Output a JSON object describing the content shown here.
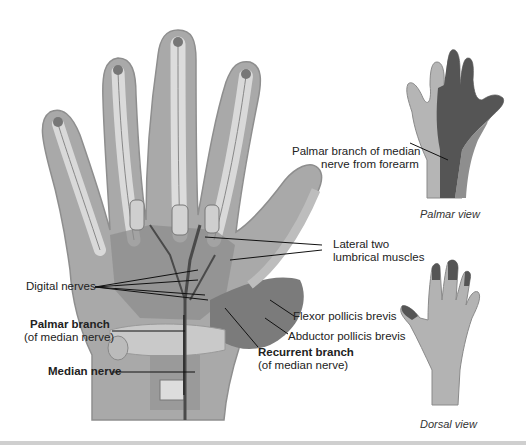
{
  "figure": {
    "main_view": {
      "labels": {
        "digital_nerves": "Digital nerves",
        "lateral_lumbricals_line1": "Lateral two",
        "lateral_lumbricals_line2": "lumbrical muscles",
        "palmar_branch_title": "Palmar branch",
        "palmar_branch_sub": "(of median nerve)",
        "median_nerve": "Median nerve",
        "flexor_pollicis_brevis": "Flexor pollicis brevis",
        "abductor_pollicis_brevis": "Abductor pollicis brevis",
        "recurrent_branch_title": "Recurrent branch",
        "recurrent_branch_sub": "(of median nerve)"
      }
    },
    "palmar_inset": {
      "label_line1": "Palmar branch of median",
      "label_line2": "nerve from forearm",
      "caption": "Palmar view"
    },
    "dorsal_inset": {
      "caption": "Dorsal view"
    },
    "colors": {
      "skin_outline": "#9a9a9a",
      "skin_fill": "#a8a8a8",
      "muscle": "#7a7a7a",
      "tendon": "#d8d8d8",
      "nerve": "#4a4a4a",
      "inset_light": "#b5b5b5",
      "inset_dark": "#555555",
      "inset_mid": "#8e8e8e"
    }
  }
}
